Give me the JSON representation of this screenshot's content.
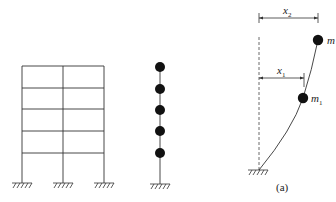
{
  "figure": {
    "frame": {
      "stories": 5,
      "bays": 2,
      "supports": 3
    },
    "lumped_model": {
      "masses": 5
    },
    "deflected_model": {
      "labels": {
        "top_mass": "m",
        "lower_mass_base": "m",
        "lower_mass_sub": "1",
        "dim_top_base": "x",
        "dim_top_sub": "2",
        "dim_lower_base": "x",
        "dim_lower_sub": "1"
      },
      "caption": "(a)"
    },
    "colors": {
      "line": "#333333",
      "mass": "#111111"
    }
  }
}
